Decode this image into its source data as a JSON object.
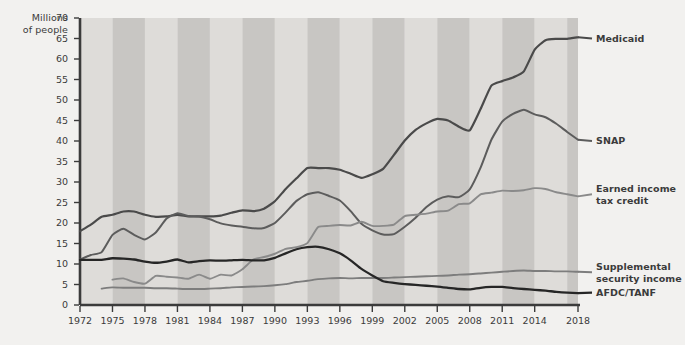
{
  "chart_data": {
    "type": "line",
    "title": "",
    "xlabel": "",
    "ylabel": "Millions of people",
    "ylim": [
      0,
      70
    ],
    "xlim": [
      1972,
      2018
    ],
    "ytick_step": 5,
    "grid": false,
    "background_bands": "alternating light and dark vertical gray bands (3-year bands)",
    "legend_position": "right, inline at line ends",
    "yticks": [
      "70",
      "65",
      "60",
      "55",
      "50",
      "45",
      "40",
      "35",
      "30",
      "25",
      "20",
      "15",
      "10",
      "5",
      "0"
    ],
    "xticks": [
      "1972",
      "1975",
      "1978",
      "1981",
      "1984",
      "1987",
      "1990",
      "1993",
      "1996",
      "1999",
      "2002",
      "2005",
      "2008",
      "2011",
      "2014",
      "2018"
    ],
    "x": [
      1972,
      1973,
      1974,
      1975,
      1976,
      1977,
      1978,
      1979,
      1980,
      1981,
      1982,
      1983,
      1984,
      1985,
      1986,
      1987,
      1988,
      1989,
      1990,
      1991,
      1992,
      1993,
      1994,
      1995,
      1996,
      1997,
      1998,
      1999,
      2000,
      2001,
      2002,
      2003,
      2004,
      2005,
      2006,
      2007,
      2008,
      2009,
      2010,
      2011,
      2012,
      2013,
      2014,
      2015,
      2016,
      2017,
      2018
    ],
    "series": [
      {
        "name": "Medicaid",
        "color": "#4a4a4a",
        "width": 2.2,
        "label_x": 2019,
        "label_y": 65,
        "values": [
          18.0,
          19.6,
          21.5,
          22.0,
          22.8,
          22.8,
          22.0,
          21.5,
          21.6,
          22.0,
          21.6,
          21.6,
          21.6,
          21.8,
          22.5,
          23.1,
          22.9,
          23.5,
          25.3,
          28.3,
          30.9,
          33.4,
          33.4,
          33.4,
          33.0,
          32.0,
          31.0,
          31.9,
          33.2,
          36.6,
          40.1,
          42.7,
          44.3,
          45.4,
          45.0,
          43.5,
          42.6,
          47.8,
          53.5,
          54.6,
          55.5,
          57.0,
          62.3,
          64.6,
          64.9,
          64.9,
          65.3
        ]
      },
      {
        "name": "SNAP",
        "color": "#5c5c5c",
        "width": 2.0,
        "label_x": 2019,
        "label_y": 40,
        "values": [
          11.1,
          12.2,
          12.9,
          17.1,
          18.6,
          17.1,
          16.0,
          17.7,
          21.1,
          22.4,
          21.7,
          21.6,
          20.9,
          19.9,
          19.4,
          19.1,
          18.7,
          18.8,
          20.0,
          22.6,
          25.4,
          27.0,
          27.5,
          26.6,
          25.5,
          22.9,
          19.8,
          18.2,
          17.2,
          17.3,
          19.1,
          21.3,
          23.9,
          25.7,
          26.5,
          26.3,
          28.2,
          33.5,
          40.3,
          44.7,
          46.6,
          47.6,
          46.5,
          45.8,
          44.2,
          42.2,
          40.3
        ]
      },
      {
        "name": "Earned income tax credit",
        "color": "#8a8a8a",
        "width": 1.9,
        "label_x": 2019,
        "label_y": 27,
        "values": [
          null,
          null,
          null,
          6.2,
          6.5,
          5.6,
          5.2,
          7.1,
          6.9,
          6.7,
          6.4,
          7.4,
          6.4,
          7.4,
          7.2,
          8.7,
          11.1,
          11.7,
          12.5,
          13.7,
          14.1,
          15.1,
          19.0,
          19.3,
          19.5,
          19.4,
          20.3,
          19.3,
          19.3,
          19.6,
          21.7,
          22.0,
          22.3,
          22.8,
          23.0,
          24.6,
          24.8,
          27.0,
          27.4,
          27.9,
          27.8,
          28.0,
          28.5,
          28.3,
          27.5,
          27.0,
          26.5
        ]
      },
      {
        "name": "Supplemental security income",
        "color": "#7d7d7d",
        "width": 1.9,
        "label_x": 2019,
        "label_y": 8,
        "values": [
          null,
          null,
          4.0,
          4.3,
          4.2,
          4.2,
          4.2,
          4.1,
          4.1,
          4.0,
          3.9,
          3.9,
          4.0,
          4.1,
          4.3,
          4.4,
          4.5,
          4.6,
          4.8,
          5.1,
          5.6,
          5.9,
          6.3,
          6.5,
          6.6,
          6.5,
          6.6,
          6.6,
          6.6,
          6.7,
          6.8,
          6.9,
          7.0,
          7.1,
          7.2,
          7.4,
          7.5,
          7.7,
          7.9,
          8.1,
          8.3,
          8.4,
          8.3,
          8.3,
          8.2,
          8.2,
          8.1
        ]
      },
      {
        "name": "AFDC/TANF",
        "color": "#262626",
        "width": 2.3,
        "label_x": 2019,
        "label_y": 3,
        "values": [
          11.0,
          11.0,
          11.0,
          11.4,
          11.3,
          11.1,
          10.6,
          10.3,
          10.6,
          11.1,
          10.4,
          10.7,
          10.9,
          10.8,
          10.9,
          11.0,
          10.9,
          10.9,
          11.5,
          12.6,
          13.6,
          14.1,
          14.2,
          13.6,
          12.6,
          10.9,
          8.8,
          7.2,
          5.8,
          5.4,
          5.1,
          4.9,
          4.7,
          4.5,
          4.2,
          3.9,
          3.8,
          4.2,
          4.4,
          4.4,
          4.1,
          3.9,
          3.7,
          3.5,
          3.2,
          3.0,
          2.9
        ]
      }
    ]
  },
  "axis": {
    "ylabel_line1": "Millions",
    "ylabel_line2": "of people"
  },
  "legend": {
    "items": [
      {
        "label_line1": "Medicaid",
        "label_line2": ""
      },
      {
        "label_line1": "SNAP",
        "label_line2": ""
      },
      {
        "label_line1": "Earned income",
        "label_line2": "tax credit"
      },
      {
        "label_line1": "Supplemental",
        "label_line2": "security income"
      },
      {
        "label_line1": "AFDC/TANF",
        "label_line2": ""
      }
    ]
  },
  "colors": {
    "page_background": "#f2f1ef",
    "band_light": "#dedcd9",
    "band_dark": "#c8c6c3",
    "axis": "#3b3b3b",
    "text": "#3b3b3b"
  }
}
